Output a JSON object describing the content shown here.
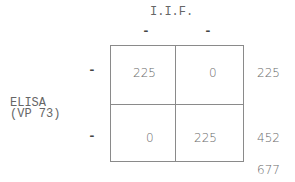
{
  "table": {
    "column_variable": "I.I.F.",
    "column_levels": [
      "-",
      "-"
    ],
    "row_variable_line1": "ELISA",
    "row_variable_line2": "(VP 73)",
    "row_levels": [
      "-",
      "-"
    ],
    "cells": [
      [
        "225",
        "0"
      ],
      [
        "0",
        "225"
      ]
    ],
    "row_totals": [
      "225",
      "452"
    ],
    "grand_total": "677"
  }
}
